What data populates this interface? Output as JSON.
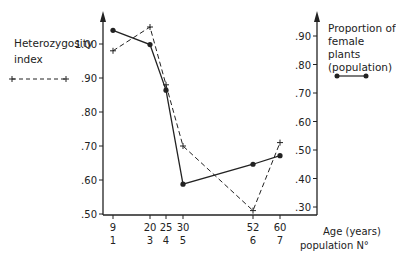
{
  "chart_data": {
    "type": "line",
    "title": "",
    "xlabel": "Age (years) / population N°",
    "x": [
      9,
      20,
      25,
      30,
      52,
      60
    ],
    "x_tick_labels_age": [
      "9",
      "20",
      "25",
      "30",
      "52",
      "60"
    ],
    "x_tick_labels_population": [
      "1",
      "3",
      "4",
      "5",
      "6",
      "7"
    ],
    "x_axis_label_line1": "Age (years)",
    "x_axis_label_line2": "population N°",
    "left_axis": {
      "label": "Heterozygosity index",
      "ticks": [
        ".50",
        ".60",
        ".70",
        ".80",
        ".90",
        "1.00"
      ],
      "ylim": [
        0.48,
        1.12
      ]
    },
    "right_axis": {
      "label": "Proportion of female plants (population)",
      "ticks": [
        ".30",
        ".40",
        ".50",
        ".60",
        ".70",
        ".80",
        ".90"
      ],
      "ylim": [
        0.27,
        0.98
      ]
    },
    "series": [
      {
        "name": "Heterozygosity index",
        "axis": "left",
        "style": "dashed",
        "marker": "plus",
        "values": [
          0.98,
          1.05,
          0.88,
          0.7,
          0.51,
          0.71
        ]
      },
      {
        "name": "Proportion of female plants (population)",
        "axis": "right",
        "style": "solid",
        "marker": "dot",
        "values": [
          0.92,
          0.87,
          0.71,
          0.38,
          0.45,
          0.48
        ]
      }
    ],
    "grid": false,
    "legend_position": "left and right of plot"
  },
  "legend": {
    "left_line1": "Heterozygosity",
    "left_line2": "index",
    "right_line1": "Proportion of",
    "right_line2": "female plants",
    "right_line3": "(population)"
  }
}
